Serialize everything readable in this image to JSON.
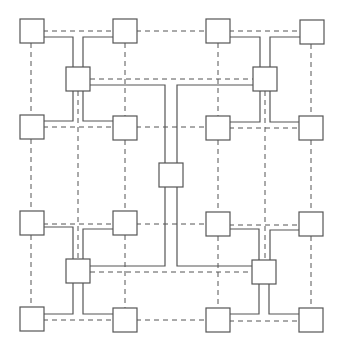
{
  "diagram": {
    "title": "",
    "colors": {
      "stroke": "#555555",
      "background": "#ffffff",
      "node_fill": "#ffffff"
    },
    "node_size": 24,
    "nodes": [
      {
        "id": "n00",
        "role": "leaf",
        "x": 20,
        "y": 19
      },
      {
        "id": "n01",
        "role": "leaf",
        "x": 113,
        "y": 19
      },
      {
        "id": "n02",
        "role": "leaf",
        "x": 206,
        "y": 19
      },
      {
        "id": "n03",
        "role": "leaf",
        "x": 300,
        "y": 20
      },
      {
        "id": "h0",
        "role": "hub",
        "x": 66,
        "y": 67
      },
      {
        "id": "h1",
        "role": "hub",
        "x": 253,
        "y": 67
      },
      {
        "id": "n10",
        "role": "leaf",
        "x": 20,
        "y": 115
      },
      {
        "id": "n11",
        "role": "leaf",
        "x": 113,
        "y": 116
      },
      {
        "id": "n12",
        "role": "leaf",
        "x": 206,
        "y": 116
      },
      {
        "id": "n13",
        "role": "leaf",
        "x": 299,
        "y": 116
      },
      {
        "id": "c",
        "role": "center",
        "x": 159,
        "y": 163
      },
      {
        "id": "n20",
        "role": "leaf",
        "x": 20,
        "y": 211
      },
      {
        "id": "n21",
        "role": "leaf",
        "x": 113,
        "y": 211
      },
      {
        "id": "n22",
        "role": "leaf",
        "x": 206,
        "y": 212
      },
      {
        "id": "n23",
        "role": "leaf",
        "x": 299,
        "y": 212
      },
      {
        "id": "h2",
        "role": "hub",
        "x": 66,
        "y": 259
      },
      {
        "id": "h3",
        "role": "hub",
        "x": 252,
        "y": 260
      },
      {
        "id": "n30",
        "role": "leaf",
        "x": 20,
        "y": 307
      },
      {
        "id": "n31",
        "role": "leaf",
        "x": 113,
        "y": 308
      },
      {
        "id": "n32",
        "role": "leaf",
        "x": 206,
        "y": 308
      },
      {
        "id": "n33",
        "role": "leaf",
        "x": 299,
        "y": 308
      }
    ],
    "solid_links": [
      "M43,37 H73 V67",
      "M83,67 V37 H113",
      "M73,91 V121 H43",
      "M83,91 V121 H113",
      "M229,37 H260 V67",
      "M270,67 V37 H300",
      "M260,91 V122 H229",
      "M270,91 V122 H299",
      "M73,259 V227 H43",
      "M83,259 V229 H113",
      "M73,283 V314 H43",
      "M83,283 V314 H113",
      "M259,260 V229 H229",
      "M270,260 V230 H299",
      "M259,284 V314 H229",
      "M269,284 V314 H299",
      "M90,85 H165 V163",
      "M177,163 V85 H253",
      "M90,266 H165 V187",
      "M177,187 V266 H252"
    ],
    "dashed_links": [
      "M43,31 H113",
      "M136,31 H206",
      "M229,31 H300",
      "M90,79 H253",
      "M43,127 H113",
      "M136,127 H206",
      "M229,128 H299",
      "M43,224 H113",
      "M136,224 H206",
      "M229,225 H299",
      "M90,272 H252",
      "M43,320 H113",
      "M136,320 H206",
      "M229,321 H299",
      "M31,43 V115",
      "M31,139 V211",
      "M31,235 V307",
      "M125,43 V116",
      "M125,140 V211",
      "M125,235 V308",
      "M218,43 V116",
      "M218,140 V212",
      "M218,236 V308",
      "M311,44 V116",
      "M311,140 V212",
      "M311,236 V308",
      "M78,91 V259",
      "M265,91 V260"
    ]
  }
}
